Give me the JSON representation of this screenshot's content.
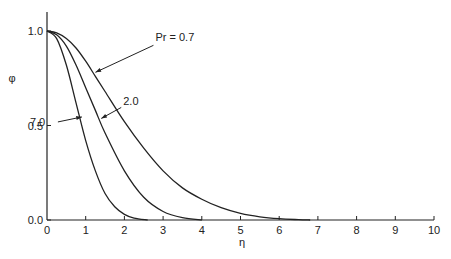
{
  "chart_data": {
    "type": "line",
    "title": "",
    "xlabel": "η",
    "ylabel": "φ",
    "xlim": [
      0,
      10
    ],
    "ylim": [
      0,
      1.0
    ],
    "x_ticks": [
      "0",
      "1",
      "2",
      "3",
      "4",
      "5",
      "6",
      "7",
      "8",
      "9",
      "10"
    ],
    "y_ticks": [
      "0.0",
      "0.5",
      "1.0"
    ],
    "grid": false,
    "legend": "inline annotations with arrows",
    "series": [
      {
        "name": "Pr = 0.7",
        "label": "Pr = 0.7",
        "x": [
          0,
          0.25,
          0.5,
          0.75,
          1,
          1.25,
          1.5,
          2,
          2.5,
          3,
          3.5,
          4,
          4.5,
          5,
          5.5,
          6,
          6.5,
          6.8
        ],
        "y": [
          1.0,
          0.99,
          0.96,
          0.91,
          0.84,
          0.76,
          0.68,
          0.52,
          0.38,
          0.26,
          0.17,
          0.11,
          0.065,
          0.035,
          0.017,
          0.007,
          0.002,
          0.0
        ]
      },
      {
        "name": "Pr = 2.0",
        "label": "2.0",
        "x": [
          0,
          0.25,
          0.5,
          0.75,
          1,
          1.25,
          1.5,
          2,
          2.5,
          3,
          3.5,
          4
        ],
        "y": [
          1.0,
          0.98,
          0.92,
          0.82,
          0.7,
          0.58,
          0.46,
          0.26,
          0.12,
          0.045,
          0.012,
          0.0
        ]
      },
      {
        "name": "Pr = 7.0",
        "label": "7.0",
        "x": [
          0,
          0.25,
          0.5,
          0.75,
          1,
          1.25,
          1.5,
          1.75,
          2,
          2.25,
          2.6
        ],
        "y": [
          1.0,
          0.96,
          0.82,
          0.62,
          0.42,
          0.26,
          0.14,
          0.07,
          0.03,
          0.01,
          0.0
        ]
      }
    ],
    "annotations": [
      {
        "text": "Pr = 0.7",
        "at_x": 1.2
      },
      {
        "text": "2.0",
        "at_x": 1.35
      },
      {
        "text": "7.0",
        "at_x": 0.85
      }
    ]
  }
}
